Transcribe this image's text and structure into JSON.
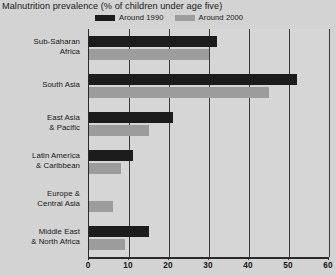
{
  "chart_data": {
    "type": "bar",
    "orientation": "horizontal",
    "title": "Malnutrition prevalence (% of children under age five)",
    "xlabel": "",
    "ylabel": "",
    "xlim": [
      0,
      60
    ],
    "xticks": [
      0,
      10,
      20,
      30,
      40,
      50,
      60
    ],
    "grid": true,
    "legend_position": "top",
    "categories": [
      "Sub-Saharan Africa",
      "South Asia",
      "East Asia & Pacific",
      "Latin America & Caribbean",
      "Europe & Central Asia",
      "Middle East & North Africa"
    ],
    "category_lines": [
      [
        "Sub-Saharan",
        "Africa"
      ],
      [
        "South Asia",
        ""
      ],
      [
        "East Asia",
        "& Pacific"
      ],
      [
        "Latin America",
        "& Caribbean"
      ],
      [
        "Europe &",
        "Central Asia"
      ],
      [
        "Middle East",
        "& North Africa"
      ]
    ],
    "series": [
      {
        "name": "Around 1990",
        "color": "#1c1c1c",
        "values": [
          32,
          52,
          21,
          11,
          0,
          15
        ]
      },
      {
        "name": "Around 2000",
        "color": "#9c9c9c",
        "values": [
          30,
          45,
          15,
          8,
          6,
          9
        ]
      }
    ]
  },
  "colors": {
    "background": "#d3d3d3",
    "panel": "#d6d6d6",
    "axis": "#2a2a2a",
    "grid": "#3a3a3a",
    "text": "#161616",
    "series_1990": "#1c1c1c",
    "series_2000": "#9c9c9c"
  }
}
